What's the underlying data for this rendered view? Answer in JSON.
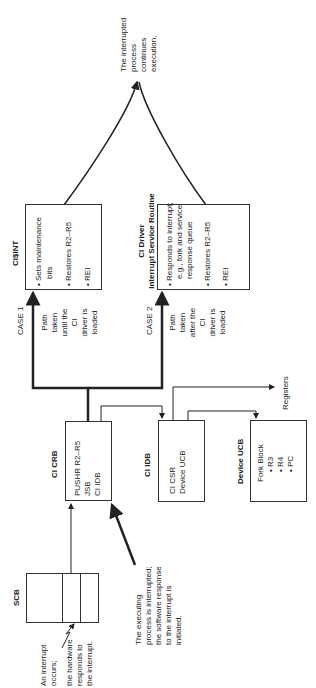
{
  "scb": {
    "title": "SCB"
  },
  "ci_crb": {
    "title": "CI CRB",
    "lines": [
      "PUSHR R2–R5",
      "JSB",
      "CI IDB"
    ]
  },
  "ci_idb": {
    "title": "CI IDB",
    "lines": [
      "CI CSR",
      "Device UCB"
    ]
  },
  "device_ucb": {
    "title": "Device UCB",
    "lines": [
      "Fork Block",
      "• R3",
      "• R4",
      "• PC"
    ]
  },
  "ci_int": {
    "title": "CI$INT",
    "items": [
      "• Sets maintenance",
      "bits",
      "• Restores R2–R5",
      "• REI"
    ]
  },
  "ci_driver": {
    "title_line1": "CI Driver",
    "title_line2": "Interrupt Service Routine",
    "items": [
      "• Responds to interrupt;",
      "e.g., fork and service",
      "response queue",
      "• Restores R2–R5",
      "• REI"
    ]
  },
  "case1": {
    "label": "CASE 1",
    "note": [
      "Path",
      "taken",
      "until the",
      "CI",
      "driver is",
      "loaded"
    ]
  },
  "case2": {
    "label": "CASE 2",
    "note": [
      "Path",
      "taken",
      "after the",
      "CI",
      "driver is",
      "loaded"
    ]
  },
  "registers": {
    "label": "Registers"
  },
  "interrupt_note": {
    "lines": [
      "An interrupt",
      "occurs;",
      "the hardware",
      "responds to",
      "the interrupt."
    ]
  },
  "executing_note": {
    "lines": [
      "The executing",
      "process is interrupted;",
      "the software response",
      "to the interrupt is",
      "initiated."
    ]
  },
  "continues_note": {
    "lines": [
      "The interrupted",
      "process",
      "continues",
      "execution."
    ]
  }
}
